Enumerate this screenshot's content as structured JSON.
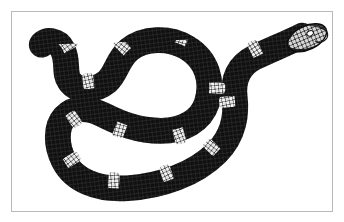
{
  "document": {
    "kind": "scientific-illustration",
    "title": "",
    "caption": "",
    "medium": "black-and-white engraving",
    "subject": "banded snake",
    "background_color": "#ffffff",
    "border_color": "#b9b9b9",
    "ink_color": "#111111",
    "scale_color": "#ffffff"
  },
  "frame": {
    "x": 11,
    "y": 11,
    "width": 322,
    "height": 201,
    "border_width": 1
  },
  "illustration": {
    "name": "coiled-banded-snake",
    "description": "A banded snake drawn in dense cross-hatched engraving style, body looped into a closed coil at upper-left-of-center with an open white eyelet, the tail extending to the upper left and the head raised at the upper right.",
    "extents": {
      "left": 26,
      "top": 18,
      "right": 318,
      "bottom": 187
    },
    "parts": [
      {
        "name": "head",
        "x": 300,
        "y": 30
      },
      {
        "name": "eye",
        "x": 302,
        "y": 31
      },
      {
        "name": "neck",
        "x": 265,
        "y": 55
      },
      {
        "name": "coil-eyelet",
        "x": 152,
        "y": 82
      },
      {
        "name": "tail-tip",
        "x": 30,
        "y": 38
      }
    ],
    "band_count": 14,
    "bands": [
      {
        "index": 0,
        "t": 0.03
      },
      {
        "index": 1,
        "t": 0.1
      },
      {
        "index": 2,
        "t": 0.17
      },
      {
        "index": 3,
        "t": 0.24
      },
      {
        "index": 4,
        "t": 0.31
      },
      {
        "index": 5,
        "t": 0.38
      },
      {
        "index": 6,
        "t": 0.45
      },
      {
        "index": 7,
        "t": 0.52
      },
      {
        "index": 8,
        "t": 0.59
      },
      {
        "index": 9,
        "t": 0.66
      },
      {
        "index": 10,
        "t": 0.73
      },
      {
        "index": 11,
        "t": 0.8
      },
      {
        "index": 12,
        "t": 0.87
      },
      {
        "index": 13,
        "t": 0.94
      }
    ]
  }
}
